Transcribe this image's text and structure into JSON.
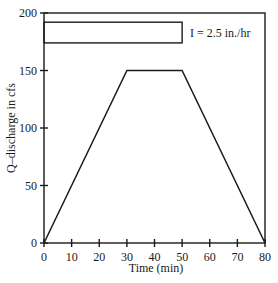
{
  "chart_data": {
    "type": "line",
    "title": "",
    "xlabel": "Time (min)",
    "ylabel": "Q–discharge in cfs",
    "xlim": [
      0,
      80
    ],
    "ylim": [
      0,
      200
    ],
    "x_ticks": [
      0,
      10,
      20,
      30,
      40,
      50,
      60,
      70,
      80
    ],
    "y_ticks": [
      0,
      50,
      100,
      150,
      200
    ],
    "grid": false,
    "legend": null,
    "series": [
      {
        "name": "Hydrograph (Q)",
        "x": [
          0,
          30,
          50,
          80
        ],
        "y": [
          0,
          150,
          150,
          0
        ]
      }
    ],
    "rainfall_block": {
      "label": "I = 2.5 in./hr",
      "x_start": 0,
      "x_end": 50,
      "y_top": 192,
      "y_bottom": 174
    },
    "annotations": [
      "I = 2.5 in./hr"
    ]
  },
  "labels": {
    "xlabel": "Time (min)",
    "ylabel": "Q–discharge in cfs",
    "intensity": "I = 2.5 in./hr",
    "xticks": [
      "0",
      "10",
      "20",
      "30",
      "40",
      "50",
      "60",
      "70",
      "80"
    ],
    "yticks": [
      "0",
      "50",
      "100",
      "150",
      "200"
    ]
  }
}
